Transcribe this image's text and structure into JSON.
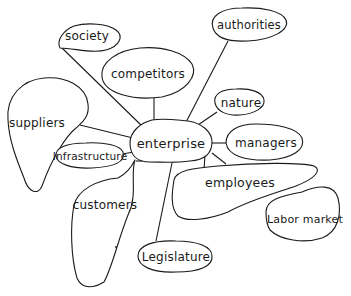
{
  "diagram": {
    "type": "mind-map",
    "style": "hand-drawn",
    "center": {
      "label": "enterprise"
    },
    "nodes": [
      {
        "id": "society",
        "label": "society"
      },
      {
        "id": "authorities",
        "label": "authorities"
      },
      {
        "id": "competitors",
        "label": "competitors"
      },
      {
        "id": "suppliers",
        "label": "suppliers"
      },
      {
        "id": "nature",
        "label": "nature"
      },
      {
        "id": "managers",
        "label": "managers"
      },
      {
        "id": "infrastructure",
        "label": "Infrastructure"
      },
      {
        "id": "employees",
        "label": "employees"
      },
      {
        "id": "customers",
        "label": "customers"
      },
      {
        "id": "labor_market",
        "label": "Labor market"
      },
      {
        "id": "legislature",
        "label": "Legislature"
      }
    ],
    "edges": [
      [
        "enterprise",
        "society"
      ],
      [
        "enterprise",
        "authorities"
      ],
      [
        "enterprise",
        "competitors"
      ],
      [
        "enterprise",
        "suppliers"
      ],
      [
        "enterprise",
        "nature"
      ],
      [
        "enterprise",
        "managers"
      ],
      [
        "enterprise",
        "infrastructure"
      ],
      [
        "enterprise",
        "employees"
      ],
      [
        "enterprise",
        "customers"
      ],
      [
        "enterprise",
        "legislature"
      ],
      [
        "employees",
        "labor_market"
      ]
    ],
    "colors": {
      "stroke": "#1a1a1a",
      "background": "#ffffff"
    }
  }
}
